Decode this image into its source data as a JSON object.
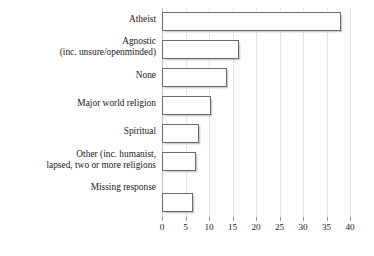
{
  "chart_data": {
    "type": "bar",
    "orientation": "horizontal",
    "title": "",
    "subtitle": "",
    "xlabel": "",
    "ylabel": "",
    "xlim": [
      0,
      40
    ],
    "ylim": null,
    "grid": "vertical-dotted",
    "legend": "none",
    "xticks": [
      0,
      5,
      10,
      15,
      20,
      25,
      30,
      35,
      40
    ],
    "xtick_labels": [
      "0",
      "5",
      "10",
      "15",
      "20",
      "25",
      "30",
      "35",
      "40"
    ],
    "categories": [
      "Atheist",
      "Agnostic\n(inc. unsure/openminded)",
      "None",
      "Major world religion",
      "Spiritual",
      "Other (inc. humanist,\nlapsed, two or more religions",
      "Missing response"
    ],
    "values": [
      38,
      16.3,
      13.8,
      10.5,
      7.8,
      7.2,
      6.5
    ],
    "series": [
      {
        "name": "",
        "values": [
          38,
          16.3,
          13.8,
          10.5,
          7.8,
          7.2,
          6.5
        ]
      }
    ],
    "bar_face_color": "#ffffff",
    "bar_edge_color": "#6b6b6b",
    "gridline_color": "#cfcfcf",
    "axis_color": "#9a9a9a",
    "text_color": "#1a1a1a",
    "background_color": "#ffffff"
  }
}
